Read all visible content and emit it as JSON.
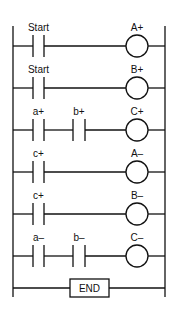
{
  "diagram": {
    "type": "ladder-logic",
    "rungs": [
      {
        "contacts": [
          "Start"
        ],
        "coil": "A+",
        "y": 46
      },
      {
        "contacts": [
          "Start"
        ],
        "coil": "B+",
        "y": 88
      },
      {
        "contacts": [
          "a+",
          "b+"
        ],
        "coil": "C+",
        "y": 130
      },
      {
        "contacts": [
          "c+"
        ],
        "coil": "A–",
        "y": 172
      },
      {
        "contacts": [
          "c+"
        ],
        "coil": "B–",
        "y": 214
      },
      {
        "contacts": [
          "a–",
          "b–"
        ],
        "coil": "C–",
        "y": 256
      }
    ],
    "end_label": "END"
  }
}
